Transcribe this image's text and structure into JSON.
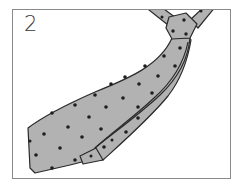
{
  "figure": {
    "step_number": "2",
    "colors": {
      "tie_fill": "#b2b2b2",
      "tie_outline": "#2a2a2a",
      "dot": "#1e1e1e",
      "frame_border": "#8a8a8a",
      "background": "#ffffff",
      "text": "#3a3a3a"
    }
  }
}
